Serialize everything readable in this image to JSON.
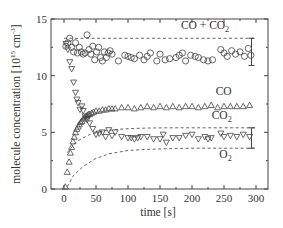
{
  "chart_data": {
    "type": "scatter",
    "title": "",
    "xlabel": "time [s]",
    "ylabel": "molecule concentration [10^15 cm^-3]",
    "ylabel_parts": {
      "main": "molecule concentration [10",
      "exp1": "15",
      "mid": " cm",
      "exp2": "-3",
      "end": "]"
    },
    "xlim": [
      -20,
      320
    ],
    "ylim": [
      0,
      15
    ],
    "xticks": [
      0,
      50,
      100,
      150,
      200,
      250,
      300
    ],
    "yticks": [
      0,
      5,
      10,
      15
    ],
    "grid": false,
    "legend": "inline labels",
    "annotations": [
      {
        "text": "CO + CO",
        "sub": "2",
        "x": 258,
        "y": 14.1
      },
      {
        "text": "CO",
        "sub": "",
        "x": 262,
        "y": 8.3
      },
      {
        "text": "CO",
        "sub": "2",
        "x": 262,
        "y": 6.2
      },
      {
        "text": "O",
        "sub": "2",
        "x": 262,
        "y": 2.7
      }
    ],
    "series": [
      {
        "name": "CO + CO2",
        "marker": "circle",
        "x": [
          3,
          6,
          9,
          12,
          15,
          18,
          21,
          24,
          27,
          30,
          33,
          36,
          39,
          42,
          45,
          48,
          51,
          54,
          57,
          60,
          63,
          66,
          69,
          72,
          75,
          85,
          95,
          100,
          105,
          110,
          118,
          125,
          130,
          135,
          145,
          150,
          158,
          165,
          175,
          180,
          185,
          190,
          198,
          205,
          210,
          218,
          225,
          232,
          245,
          250,
          255,
          262,
          268,
          275,
          282,
          288,
          292
        ],
        "y": [
          12.6,
          12.9,
          13.3,
          12.5,
          12.1,
          12.9,
          12.0,
          12.5,
          12.1,
          11.9,
          12.0,
          13.6,
          12.3,
          11.9,
          12.6,
          11.4,
          12.1,
          12.5,
          11.6,
          11.3,
          12.1,
          11.6,
          12.0,
          12.2,
          11.9,
          11.3,
          11.8,
          11.7,
          11.6,
          11.5,
          11.8,
          11.4,
          11.7,
          12.0,
          11.3,
          11.9,
          11.4,
          11.5,
          11.6,
          11.8,
          12.0,
          11.3,
          11.8,
          11.7,
          11.6,
          11.4,
          11.3,
          11.4,
          12.3,
          12.0,
          11.7,
          12.2,
          11.9,
          12.1,
          11.7,
          12.4,
          11.8
        ]
      },
      {
        "name": "CO",
        "marker": "triangle-up",
        "x": [
          2,
          5,
          8,
          10,
          12,
          14,
          16,
          18,
          20,
          22,
          24,
          26,
          28,
          30,
          32,
          34,
          36,
          38,
          40,
          43,
          46,
          50,
          55,
          60,
          65,
          70,
          75,
          80,
          90,
          100,
          110,
          120,
          130,
          140,
          150,
          160,
          170,
          180,
          190,
          200,
          210,
          220,
          230,
          240,
          250,
          260,
          270,
          280,
          290
        ],
        "y": [
          0.2,
          1.5,
          2.4,
          3.2,
          3.7,
          4.2,
          4.6,
          5.0,
          5.3,
          5.5,
          5.7,
          5.9,
          6.0,
          6.2,
          6.3,
          6.4,
          6.5,
          6.6,
          6.6,
          6.7,
          6.8,
          6.9,
          6.9,
          7.0,
          7.0,
          7.1,
          7.1,
          7.1,
          7.2,
          7.2,
          7.1,
          7.2,
          7.3,
          7.2,
          7.3,
          7.2,
          7.3,
          7.2,
          7.3,
          7.3,
          7.2,
          7.3,
          7.4,
          7.2,
          7.3,
          7.3,
          7.3,
          7.3,
          7.4
        ]
      },
      {
        "name": "CO2",
        "marker": "triangle-down",
        "x": [
          3,
          6,
          9,
          12,
          15,
          18,
          20,
          22,
          25,
          28,
          30,
          33,
          36,
          40,
          45,
          50,
          55,
          60,
          65,
          70,
          75,
          80,
          90,
          100,
          105,
          110,
          115,
          120,
          130,
          140,
          150,
          155,
          160,
          170,
          180,
          190,
          200,
          210,
          220,
          225,
          230,
          245,
          250,
          260,
          270,
          280,
          290
        ],
        "y": [
          12.8,
          12.3,
          11.2,
          10.6,
          9.4,
          8.5,
          7.9,
          7.6,
          7.0,
          7.3,
          6.9,
          6.4,
          6.1,
          5.8,
          5.3,
          4.8,
          4.9,
          5.0,
          4.6,
          5.2,
          4.7,
          5.0,
          4.6,
          4.5,
          4.5,
          4.4,
          4.5,
          4.6,
          4.6,
          4.4,
          4.4,
          4.8,
          4.1,
          4.5,
          4.5,
          4.7,
          4.8,
          4.4,
          4.6,
          4.4,
          4.5,
          4.9,
          4.6,
          4.7,
          4.6,
          4.8,
          4.6
        ]
      },
      {
        "name": "CO + CO2 model (dashed)",
        "style": "dashed",
        "x": [
          0,
          300
        ],
        "y": [
          13.3,
          13.3
        ]
      },
      {
        "name": "CO2 model (dashed)",
        "style": "dashed",
        "x": [
          5,
          20,
          40,
          60,
          80,
          100,
          130,
          160,
          200,
          250,
          300
        ],
        "y": [
          3.2,
          4.2,
          4.8,
          5.1,
          5.25,
          5.32,
          5.38,
          5.4,
          5.4,
          5.4,
          5.4
        ]
      },
      {
        "name": "O2 model (dashed)",
        "style": "dashed",
        "x": [
          5,
          15,
          30,
          50,
          70,
          100,
          130,
          160,
          200,
          250,
          300
        ],
        "y": [
          0.2,
          1.2,
          2.0,
          2.7,
          3.1,
          3.4,
          3.5,
          3.55,
          3.6,
          3.6,
          3.6
        ]
      }
    ],
    "error_bars": [
      {
        "x": 293,
        "y_low": 10.9,
        "y_high": 13.3,
        "series": "CO + CO2"
      },
      {
        "x": 293,
        "y_low": 3.6,
        "y_high": 5.4,
        "series": "CO2"
      }
    ]
  }
}
